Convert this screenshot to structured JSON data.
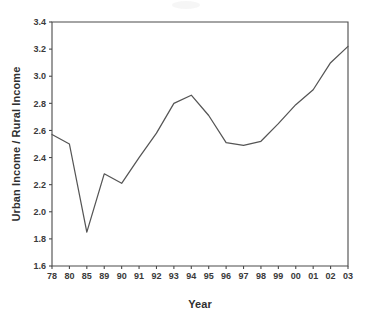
{
  "chart_data": {
    "type": "line",
    "title": "",
    "xlabel": "Year",
    "ylabel": "Urban Income / Rural Income",
    "categories": [
      "78",
      "80",
      "85",
      "89",
      "90",
      "91",
      "92",
      "93",
      "94",
      "95",
      "96",
      "97",
      "98",
      "99",
      "00",
      "01",
      "02",
      "03"
    ],
    "values": [
      2.57,
      2.5,
      1.85,
      2.28,
      2.21,
      2.4,
      2.58,
      2.8,
      2.86,
      2.71,
      2.51,
      2.49,
      2.52,
      2.65,
      2.79,
      2.9,
      3.1,
      3.22
    ],
    "series": [
      {
        "name": "Urban Income / Rural Income",
        "values": [
          2.57,
          2.5,
          1.85,
          2.28,
          2.21,
          2.4,
          2.58,
          2.8,
          2.86,
          2.71,
          2.51,
          2.49,
          2.52,
          2.65,
          2.79,
          2.9,
          3.1,
          3.22
        ]
      }
    ],
    "ylim": [
      1.6,
      3.4
    ],
    "yticks": [
      "1.6",
      "1.8",
      "2.0",
      "2.2",
      "2.4",
      "2.6",
      "2.8",
      "3.0",
      "3.2",
      "3.4"
    ],
    "ytick_values": [
      1.6,
      1.8,
      2.0,
      2.2,
      2.4,
      2.6,
      2.8,
      3.0,
      3.2,
      3.4
    ],
    "ytick_step": 0.2,
    "grid": false,
    "legend": false,
    "legend_position": "none",
    "line_color": "#555555",
    "frame_color": "#4a4a4a",
    "background_color": "#ffffff",
    "markers": false
  }
}
